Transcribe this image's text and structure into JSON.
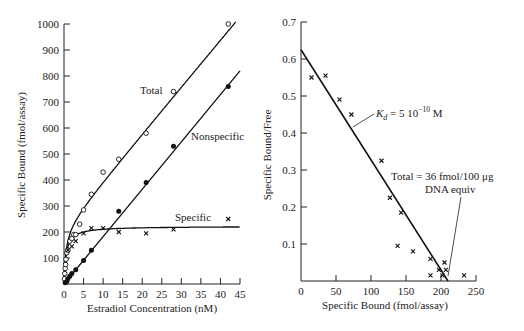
{
  "chart_data": [
    {
      "type": "scatter",
      "title": "",
      "xlabel": "Estradiol Concentration (nM)",
      "ylabel": "Specific Bound (fmol/assay)",
      "xlim": [
        0,
        45
      ],
      "ylim": [
        0,
        1000
      ],
      "xticks": [
        0,
        5,
        10,
        15,
        20,
        25,
        30,
        35,
        40,
        45
      ],
      "yticks": [
        100,
        200,
        300,
        400,
        500,
        600,
        700,
        800,
        900,
        1000
      ],
      "grid": false,
      "series": [
        {
          "name": "Total",
          "marker": "open-circle",
          "x": [
            0.1,
            0.2,
            0.3,
            0.4,
            0.5,
            0.7,
            1,
            1.5,
            2,
            2.5,
            3,
            4,
            5,
            7,
            10,
            14,
            21,
            28,
            42
          ],
          "y": [
            20,
            40,
            60,
            75,
            95,
            120,
            130,
            165,
            175,
            190,
            190,
            230,
            285,
            345,
            430,
            480,
            580,
            740,
            1000
          ]
        },
        {
          "name": "Nonspecific",
          "marker": "filled-circle",
          "x": [
            0.3,
            0.7,
            1,
            1.5,
            2,
            3,
            5,
            7,
            14,
            21,
            28,
            42
          ],
          "y": [
            5,
            10,
            20,
            30,
            40,
            55,
            90,
            130,
            280,
            390,
            530,
            760
          ]
        },
        {
          "name": "Specific",
          "marker": "x",
          "x": [
            1,
            2,
            3,
            5,
            7,
            10,
            14,
            21,
            28,
            42
          ],
          "y": [
            130,
            145,
            165,
            195,
            215,
            215,
            200,
            195,
            210,
            250
          ]
        }
      ],
      "annotations": [
        "Total",
        "Nonspecific",
        "Specific"
      ]
    },
    {
      "type": "scatter",
      "title": "",
      "xlabel": "Specific Bound (fmol/assay)",
      "ylabel": "Specific Bound/Free",
      "xlim": [
        0,
        250
      ],
      "ylim": [
        0,
        0.7
      ],
      "xticks": [
        0,
        50,
        100,
        150,
        200,
        250
      ],
      "yticks": [
        0.1,
        0.2,
        0.3,
        0.4,
        0.5,
        0.6,
        0.7
      ],
      "grid": false,
      "series": [
        {
          "name": "Scatchard points",
          "marker": "x",
          "x": [
            15,
            35,
            55,
            72,
            115,
            127,
            143,
            138,
            160,
            185,
            185,
            197,
            205,
            207,
            202,
            233
          ],
          "y": [
            0.55,
            0.555,
            0.49,
            0.45,
            0.325,
            0.225,
            0.185,
            0.095,
            0.08,
            0.06,
            0.015,
            0.03,
            0.05,
            0.03,
            0.015,
            0.015
          ]
        },
        {
          "name": "Fit line",
          "type": "line",
          "x": [
            0,
            210
          ],
          "y": [
            0.625,
            0
          ]
        }
      ],
      "annotations": [
        "K_d = 5 10^-10 M",
        "Total = 36 fmol/100 μg DNA equiv"
      ]
    }
  ],
  "left": {
    "xlabel": "Estradiol Concentration (nM)",
    "ylabel": "Specific Bound (fmol/assay)",
    "xticks": [
      "0",
      "5",
      "10",
      "15",
      "20",
      "25",
      "30",
      "35",
      "40",
      "45"
    ],
    "yticks": [
      "100",
      "200",
      "300",
      "400",
      "500",
      "600",
      "700",
      "800",
      "900",
      "1000"
    ],
    "label_total": "Total",
    "label_nonspecific": "Nonspecific",
    "label_specific": "Specific"
  },
  "right": {
    "xlabel": "Specific Bound (fmol/assay)",
    "ylabel": "Specific Bound/Free",
    "xticks": [
      "0",
      "50",
      "100",
      "150",
      "200",
      "250"
    ],
    "yticks": [
      "0.1",
      "0.2",
      "0.3",
      "0.4",
      "0.5",
      "0.6",
      "0.7"
    ],
    "kd_K": "K",
    "kd_sub": "d",
    "kd_rest": " = 5 10",
    "kd_exp": "−10",
    "kd_unit": " M",
    "total_line1": "Total = 36 fmol/100 μg",
    "total_line2": "DNA equiv"
  }
}
